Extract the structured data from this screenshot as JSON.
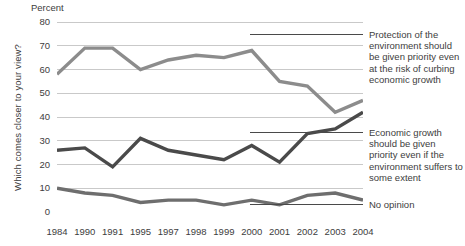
{
  "axis": {
    "y_title": "Which comes closer to your view?",
    "unit_label": "Percent",
    "y_ticks": [
      "80",
      "70",
      "60",
      "50",
      "40",
      "30",
      "20",
      "10",
      "0"
    ],
    "x_ticks": [
      "1984",
      "1990",
      "1991",
      "1995",
      "1997",
      "1998",
      "1999",
      "2000",
      "2001",
      "2002",
      "2003",
      "2004"
    ]
  },
  "annotations": {
    "environment": "Protection of the environment should be given priority even at the risk of curbing economic growth",
    "economy": "Economic growth should be given priority even if the environment suffers to some extent",
    "no_opinion": "No opinion"
  },
  "colors": {
    "environment_line": "#8c8c8c",
    "economy_line": "#4a4a4a",
    "no_opinion_line": "#6e6e6e",
    "gridline": "#c9c9c9",
    "leader_line": "#4a4a4a",
    "text": "#3d3d3d"
  },
  "chart_data": {
    "type": "line",
    "title": "",
    "xlabel": "",
    "ylabel": "Percent",
    "ylim": [
      0,
      80
    ],
    "grid": true,
    "legend_position": "right-inline-labels",
    "x": [
      "1984",
      "1990",
      "1991",
      "1995",
      "1997",
      "1998",
      "1999",
      "2000",
      "2001",
      "2002",
      "2003",
      "2004"
    ],
    "series": [
      {
        "name": "Protection of the environment should be given priority even at the risk of curbing economic growth",
        "short_name": "Protection of the environment",
        "color": "#8c8c8c",
        "values": [
          58,
          69,
          69,
          60,
          64,
          66,
          65,
          68,
          55,
          53,
          42,
          47
        ]
      },
      {
        "name": "Economic growth should be given priority even if the environment suffers to some extent",
        "short_name": "Economic growth",
        "color": "#4a4a4a",
        "values": [
          26,
          27,
          19,
          31,
          26,
          24,
          22,
          28,
          21,
          33,
          35,
          42
        ]
      },
      {
        "name": "No opinion",
        "short_name": "No opinion",
        "color": "#6e6e6e",
        "values": [
          10,
          8,
          7,
          4,
          5,
          5,
          3,
          5,
          3,
          7,
          8,
          5
        ]
      }
    ]
  }
}
